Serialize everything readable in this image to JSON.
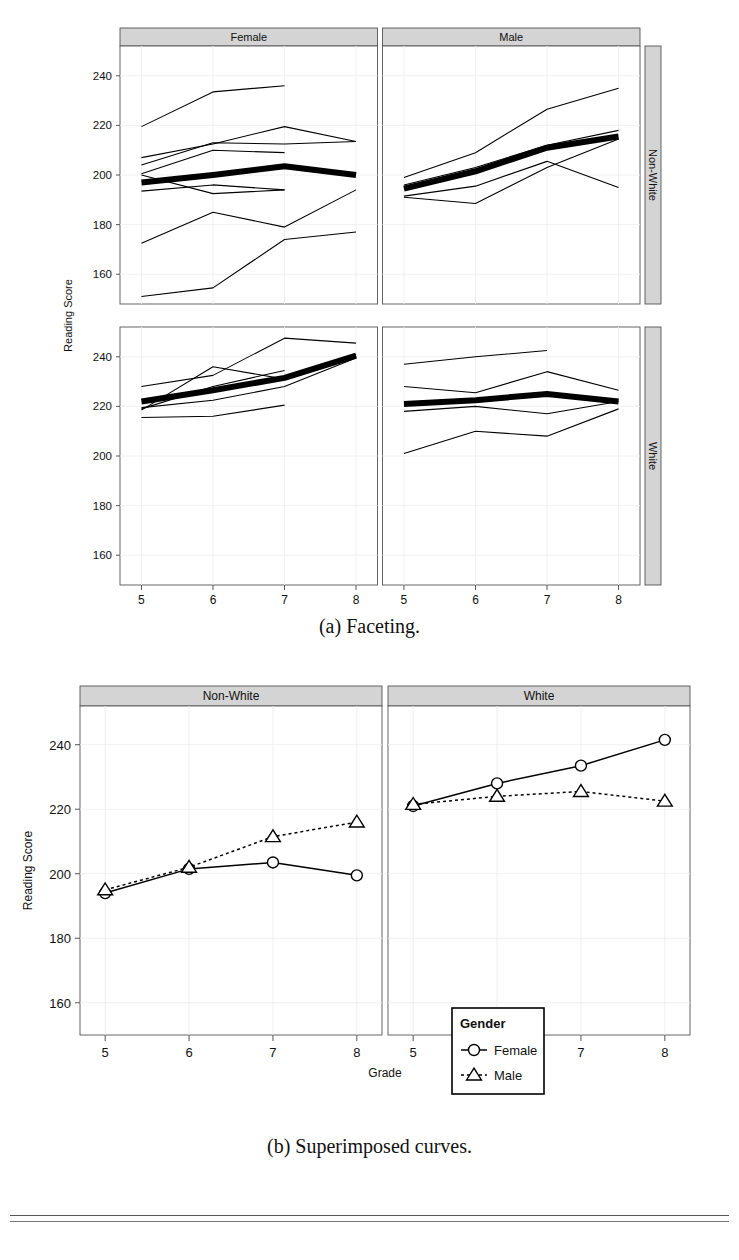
{
  "figure": {
    "caption_a": "(a) Faceting.",
    "caption_b": "(b) Superimposed curves."
  },
  "chart_data": [
    {
      "type": "line",
      "id": "faceting",
      "title": "",
      "xlabel": "Grade",
      "ylabel": "Reading Score",
      "x": [
        5,
        6,
        7,
        8
      ],
      "xlim": [
        4.7,
        8.3
      ],
      "ylim": [
        148,
        252
      ],
      "yticks": [
        160,
        180,
        200,
        220,
        240
      ],
      "xticks": [
        5,
        6,
        7,
        8
      ],
      "grid": true,
      "col_strips": [
        "Female",
        "Male"
      ],
      "row_strips": [
        "Non-White",
        "White"
      ],
      "strip_bg": "#d4d4d4",
      "panels": [
        {
          "col": "Female",
          "row": "Non-White",
          "mean_series": {
            "name": "mean",
            "values": [
              197.0,
              200.0,
              203.5,
              200.0
            ],
            "emphasis": true
          },
          "series": [
            {
              "name": "s1",
              "values": [
                219.5,
                233.5,
                236.0,
                null
              ]
            },
            {
              "name": "s2",
              "values": [
                207.0,
                212.5,
                219.5,
                213.5
              ]
            },
            {
              "name": "s3",
              "values": [
                204.0,
                213.0,
                212.5,
                213.5
              ]
            },
            {
              "name": "s4",
              "values": [
                200.5,
                210.0,
                209.0,
                null
              ]
            },
            {
              "name": "s5",
              "values": [
                193.5,
                196.0,
                194.0,
                null
              ]
            },
            {
              "name": "s6",
              "values": [
                200.0,
                192.5,
                194.0,
                null
              ]
            },
            {
              "name": "s7",
              "values": [
                172.5,
                185.0,
                179.0,
                194.0
              ]
            },
            {
              "name": "s8",
              "values": [
                151.0,
                154.5,
                174.0,
                177.0
              ]
            }
          ]
        },
        {
          "col": "Male",
          "row": "Non-White",
          "mean_series": {
            "name": "mean",
            "values": [
              194.5,
              201.5,
              211.0,
              215.5
            ],
            "emphasis": true
          },
          "series": [
            {
              "name": "s1",
              "values": [
                199.0,
                209.0,
                226.5,
                235.0
              ]
            },
            {
              "name": "s2",
              "values": [
                196.0,
                203.0,
                212.0,
                218.0
              ]
            },
            {
              "name": "s3",
              "values": [
                191.5,
                195.5,
                205.5,
                195.0
              ]
            },
            {
              "name": "s4",
              "values": [
                191.0,
                188.5,
                203.0,
                214.5
              ]
            }
          ]
        },
        {
          "col": "Female",
          "row": "White",
          "mean_series": {
            "name": "mean",
            "values": [
              222.0,
              226.5,
              231.5,
              240.5
            ],
            "emphasis": true
          },
          "series": [
            {
              "name": "s1",
              "values": [
                228.0,
                232.5,
                247.5,
                245.5
              ]
            },
            {
              "name": "s2",
              "values": [
                218.5,
                236.0,
                231.0,
                241.0
              ]
            },
            {
              "name": "s3",
              "values": [
                219.0,
                228.0,
                234.5,
                null
              ]
            },
            {
              "name": "s4",
              "values": [
                219.5,
                222.5,
                228.0,
                239.5
              ]
            },
            {
              "name": "s5",
              "values": [
                215.5,
                216.0,
                220.5,
                null
              ]
            }
          ]
        },
        {
          "col": "Male",
          "row": "White",
          "mean_series": {
            "name": "mean",
            "values": [
              221.0,
              222.5,
              225.0,
              222.0
            ],
            "emphasis": true
          },
          "series": [
            {
              "name": "s1",
              "values": [
                237.0,
                240.0,
                242.5,
                null
              ]
            },
            {
              "name": "s2",
              "values": [
                228.0,
                225.5,
                234.0,
                226.5
              ]
            },
            {
              "name": "s3",
              "values": [
                218.0,
                220.0,
                217.0,
                222.0
              ]
            },
            {
              "name": "s4",
              "values": [
                201.0,
                210.0,
                208.0,
                219.0
              ]
            }
          ]
        }
      ]
    },
    {
      "type": "line",
      "id": "superimposed",
      "title": "",
      "xlabel": "Grade",
      "ylabel": "Reading Score",
      "x": [
        5,
        6,
        7,
        8
      ],
      "xlim": [
        4.7,
        8.3
      ],
      "ylim": [
        150,
        252
      ],
      "yticks": [
        160,
        180,
        200,
        220,
        240
      ],
      "xticks": [
        5,
        6,
        7,
        8
      ],
      "grid": true,
      "col_strips": [
        "Non-White",
        "White"
      ],
      "strip_bg": "#d4d4d4",
      "legend": {
        "title": "Gender",
        "position": "inside-right-lower",
        "entries": [
          {
            "label": "Female",
            "marker": "circle",
            "line": "solid"
          },
          {
            "label": "Male",
            "marker": "triangle",
            "line": "dotted"
          }
        ]
      },
      "panels": [
        {
          "col": "Non-White",
          "series": [
            {
              "name": "Female",
              "marker": "circle",
              "line": "solid",
              "values": [
                194.0,
                201.5,
                203.5,
                199.5
              ]
            },
            {
              "name": "Male",
              "marker": "triangle",
              "line": "dotted",
              "values": [
                195.0,
                202.0,
                211.5,
                216.0
              ]
            }
          ]
        },
        {
          "col": "White",
          "series": [
            {
              "name": "Female",
              "marker": "circle",
              "line": "solid",
              "values": [
                221.0,
                228.0,
                233.5,
                241.5
              ]
            },
            {
              "name": "Male",
              "marker": "triangle",
              "line": "dotted",
              "values": [
                221.5,
                224.0,
                225.5,
                222.5
              ]
            }
          ]
        }
      ]
    }
  ]
}
